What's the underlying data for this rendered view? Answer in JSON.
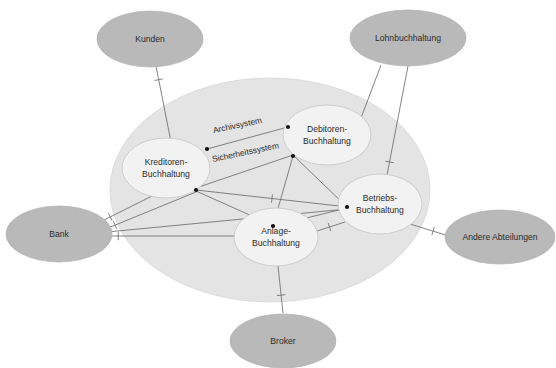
{
  "diagram": {
    "type": "system-context-diagram",
    "title": "",
    "canvas": {
      "width": 556,
      "height": 368
    },
    "colors": {
      "background": "#ffffff",
      "external_node_fill": "#b9b9b9",
      "boundary_fill": "#e4e4e4",
      "internal_node_fill": "#f2f2f2",
      "edge_stroke": "#6e6e6e",
      "text": "#2b2b2b",
      "endpoint_dot": "#121212"
    },
    "boundary": {
      "name": "system-boundary",
      "cx": 270,
      "cy": 190,
      "rx": 160,
      "ry": 112
    },
    "external_nodes": [
      {
        "id": "kunden",
        "label": "Kunden",
        "cx": 150,
        "cy": 39,
        "rx": 53,
        "ry": 28
      },
      {
        "id": "lohnbuchhaltung",
        "label": "Lohnbuchhaltung",
        "cx": 408,
        "cy": 38,
        "rx": 58,
        "ry": 28
      },
      {
        "id": "bank",
        "label": "Bank",
        "cx": 59,
        "cy": 234,
        "rx": 53,
        "ry": 28
      },
      {
        "id": "andere-abteilungen",
        "label": "Andere Abteilungen",
        "cx": 500,
        "cy": 237,
        "rx": 55,
        "ry": 27
      },
      {
        "id": "broker",
        "label": "Broker",
        "cx": 283,
        "cy": 341,
        "rx": 53,
        "ry": 27
      }
    ],
    "internal_nodes": [
      {
        "id": "kreditoren",
        "label_line1": "Kreditoren-",
        "label_line2": "Buchhaltung",
        "cx": 166,
        "cy": 168,
        "rx": 44,
        "ry": 30
      },
      {
        "id": "debitoren",
        "label_line1": "Debitoren-",
        "label_line2": "Buchhaltung",
        "cx": 327,
        "cy": 135,
        "rx": 44,
        "ry": 30
      },
      {
        "id": "betriebs",
        "label_line1": "Betriebs-",
        "label_line2": "Buchhaltung",
        "cx": 380,
        "cy": 204,
        "rx": 42,
        "ry": 30
      },
      {
        "id": "anlage",
        "label_line1": "Anlage-",
        "label_line2": "Buchhaltung",
        "cx": 276,
        "cy": 237,
        "rx": 42,
        "ry": 29
      }
    ],
    "edge_labels": [
      {
        "id": "archivsystem",
        "text": "Archivsystem",
        "x": 238,
        "y": 128,
        "rotate": -12
      },
      {
        "id": "sicherheitssystem",
        "text": "Sicherheitssystem",
        "x": 246,
        "y": 155,
        "rotate": -12
      }
    ],
    "edges": [
      {
        "id": "kunden-kreditoren",
        "from": "kunden",
        "to": "kreditoren",
        "x1": 156,
        "y1": 66,
        "x2": 171,
        "y2": 142,
        "tick_t": 0.18
      },
      {
        "id": "kreditoren-archiv-debitoren",
        "from": "kreditoren",
        "to": "debitoren",
        "x1": 207,
        "y1": 149,
        "x2": 288,
        "y2": 127,
        "tick_t": -1
      },
      {
        "id": "kreditoren-sicherheit-debitoren",
        "from": "kreditoren",
        "to": "debitoren",
        "x1": 196,
        "y1": 188,
        "x2": 293,
        "y2": 155,
        "tick_t": -1
      },
      {
        "id": "kreditoren-betriebs",
        "from": "kreditoren",
        "to": "betriebs",
        "x1": 196,
        "y1": 190,
        "x2": 348,
        "y2": 207,
        "tick_t": 0.5
      },
      {
        "id": "kreditoren-anlage",
        "from": "kreditoren",
        "to": "anlage",
        "x1": 196,
        "y1": 191,
        "x2": 272,
        "y2": 225,
        "tick_t": -1
      },
      {
        "id": "debitoren-anlage",
        "from": "debitoren",
        "to": "anlage",
        "x1": 293,
        "y1": 156,
        "x2": 273,
        "y2": 226,
        "tick_t": -1
      },
      {
        "id": "debitoren-betriebs-direct",
        "from": "debitoren",
        "to": "betriebs",
        "x1": 294,
        "y1": 156,
        "x2": 347,
        "y2": 207,
        "tick_t": -1
      },
      {
        "id": "anlage-betriebs",
        "from": "anlage",
        "to": "betriebs",
        "x1": 274,
        "y1": 226,
        "x2": 347,
        "y2": 208,
        "tick_t": -1
      },
      {
        "id": "debitoren-lohn",
        "from": "debitoren",
        "to": "lohnbuchhaltung",
        "x1": 344,
        "y1": 163,
        "x2": 381,
        "y2": 65,
        "tick_t": 0.15
      },
      {
        "id": "betriebs-lohn",
        "from": "betriebs",
        "to": "lohnbuchhaltung",
        "x1": 387,
        "y1": 175,
        "x2": 408,
        "y2": 66,
        "tick_t": 0.12
      },
      {
        "id": "betriebs-andere",
        "from": "betriebs",
        "to": "andere-abteilungen",
        "x1": 410,
        "y1": 224,
        "x2": 452,
        "y2": 237,
        "tick_t": 0.55
      },
      {
        "id": "betriebs-anlage-ext",
        "from": "betriebs",
        "to": "anlage",
        "x1": 345,
        "y1": 222,
        "x2": 314,
        "y2": 232,
        "tick_t": 0.5
      },
      {
        "id": "anlage-broker",
        "from": "anlage",
        "to": "broker",
        "x1": 278,
        "y1": 266,
        "x2": 283,
        "y2": 313,
        "tick_t": 0.62
      },
      {
        "id": "bank-anlage",
        "from": "bank",
        "to": "anlage",
        "x1": 112,
        "y1": 236,
        "x2": 237,
        "y2": 236,
        "tick_t": 0.05
      },
      {
        "id": "bank-kreditoren-a",
        "from": "bank",
        "to": "kreditoren",
        "x1": 108,
        "y1": 228,
        "x2": 196,
        "y2": 192,
        "tick_t": 0.08
      },
      {
        "id": "bank-kreditoren-b",
        "from": "bank",
        "to": "kreditoren",
        "x1": 104,
        "y1": 220,
        "x2": 152,
        "y2": 196,
        "tick_t": 0.13
      },
      {
        "id": "bank-betriebs-long",
        "from": "bank",
        "to": "betriebs",
        "x1": 107,
        "y1": 232,
        "x2": 347,
        "y2": 209,
        "tick_t": -1
      }
    ],
    "endpoint_dots": [
      {
        "id": "dot-kreditoren-top",
        "cx": 207,
        "cy": 149
      },
      {
        "id": "dot-kreditoren-bottom",
        "cx": 196,
        "cy": 190
      },
      {
        "id": "dot-debitoren-left",
        "cx": 288,
        "cy": 127
      },
      {
        "id": "dot-debitoren-lower",
        "cx": 293,
        "cy": 156
      },
      {
        "id": "dot-betriebs-left",
        "cx": 347,
        "cy": 207
      },
      {
        "id": "dot-anlage-top",
        "cx": 273,
        "cy": 226
      }
    ]
  }
}
